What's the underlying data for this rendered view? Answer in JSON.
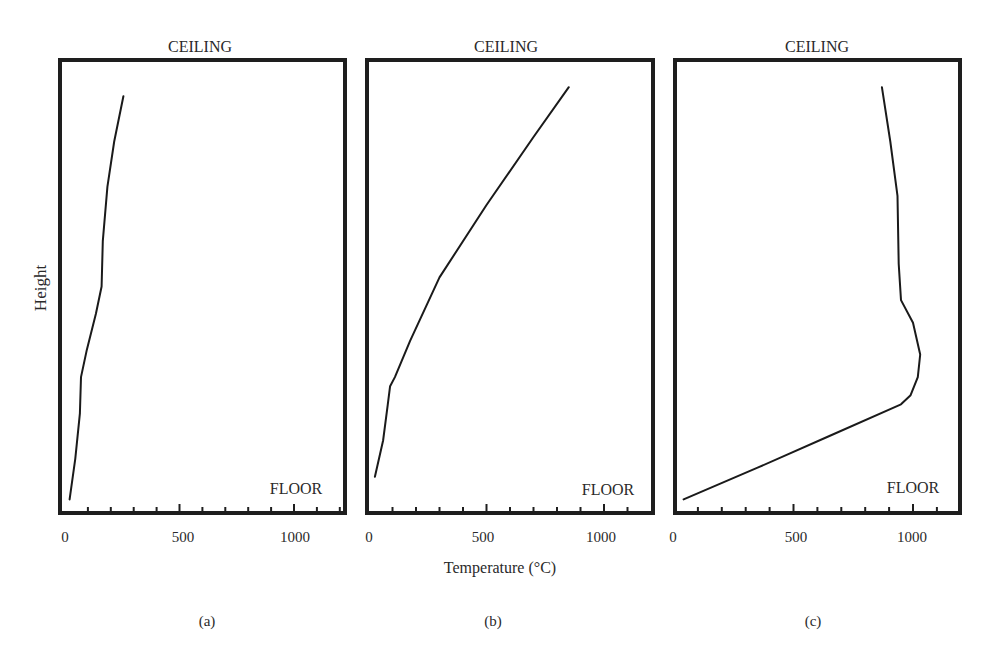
{
  "figure": {
    "y_axis_label": "Height",
    "x_axis_label": "Temperature (°C)",
    "top_label": "CEILING",
    "bottom_label": "FLOOR"
  },
  "chart_data": [
    {
      "type": "line",
      "panel": "(a)",
      "title": "CEILING",
      "annotation": "FLOOR",
      "xlabel": "",
      "ylabel": "Height",
      "xlim": [
        0,
        1200
      ],
      "ylim": [
        0,
        1
      ],
      "xticks": [
        0,
        500,
        1000
      ],
      "minor_tick_step": 100,
      "series": [
        {
          "name": "temperature profile",
          "points": [
            {
              "temp": 20,
              "height": 0.03
            },
            {
              "temp": 45,
              "height": 0.12
            },
            {
              "temp": 65,
              "height": 0.22
            },
            {
              "temp": 70,
              "height": 0.3
            },
            {
              "temp": 95,
              "height": 0.36
            },
            {
              "temp": 135,
              "height": 0.44
            },
            {
              "temp": 160,
              "height": 0.5
            },
            {
              "temp": 165,
              "height": 0.6
            },
            {
              "temp": 185,
              "height": 0.72
            },
            {
              "temp": 215,
              "height": 0.82
            },
            {
              "temp": 255,
              "height": 0.92
            }
          ]
        }
      ]
    },
    {
      "type": "line",
      "panel": "(b)",
      "title": "CEILING",
      "annotation": "FLOOR",
      "xlabel": "Temperature (°C)",
      "ylabel": "",
      "xlim": [
        0,
        1200
      ],
      "ylim": [
        0,
        1
      ],
      "xticks": [
        0,
        500,
        1000
      ],
      "minor_tick_step": 100,
      "series": [
        {
          "name": "temperature profile",
          "points": [
            {
              "temp": 25,
              "height": 0.08
            },
            {
              "temp": 60,
              "height": 0.16
            },
            {
              "temp": 80,
              "height": 0.24
            },
            {
              "temp": 90,
              "height": 0.28
            },
            {
              "temp": 110,
              "height": 0.3
            },
            {
              "temp": 175,
              "height": 0.38
            },
            {
              "temp": 300,
              "height": 0.52
            },
            {
              "temp": 500,
              "height": 0.68
            },
            {
              "temp": 700,
              "height": 0.83
            },
            {
              "temp": 850,
              "height": 0.94
            }
          ]
        }
      ]
    },
    {
      "type": "line",
      "panel": "(c)",
      "title": "CEILING",
      "annotation": "FLOOR",
      "xlabel": "",
      "ylabel": "",
      "xlim": [
        0,
        1200
      ],
      "ylim": [
        0,
        1
      ],
      "xticks": [
        0,
        500,
        1000
      ],
      "minor_tick_step": 100,
      "series": [
        {
          "name": "temperature profile",
          "points": [
            {
              "temp": 40,
              "height": 0.03
            },
            {
              "temp": 350,
              "height": 0.1
            },
            {
              "temp": 650,
              "height": 0.17
            },
            {
              "temp": 950,
              "height": 0.24
            },
            {
              "temp": 990,
              "height": 0.26
            },
            {
              "temp": 1020,
              "height": 0.3
            },
            {
              "temp": 1030,
              "height": 0.35
            },
            {
              "temp": 1000,
              "height": 0.42
            },
            {
              "temp": 950,
              "height": 0.47
            },
            {
              "temp": 940,
              "height": 0.55
            },
            {
              "temp": 935,
              "height": 0.7
            },
            {
              "temp": 905,
              "height": 0.82
            },
            {
              "temp": 870,
              "height": 0.94
            }
          ]
        }
      ]
    }
  ],
  "panels": [
    {
      "id": "a",
      "caption": "(a)",
      "ceiling": "CEILING",
      "floor": "FLOOR",
      "tick_labels": [
        "0",
        "500",
        "1000"
      ]
    },
    {
      "id": "b",
      "caption": "(b)",
      "ceiling": "CEILING",
      "floor": "FLOOR",
      "tick_labels": [
        "0",
        "500",
        "1000"
      ]
    },
    {
      "id": "c",
      "caption": "(c)",
      "ceiling": "CEILING",
      "floor": "FLOOR",
      "tick_labels": [
        "0",
        "500",
        "1000"
      ]
    }
  ]
}
